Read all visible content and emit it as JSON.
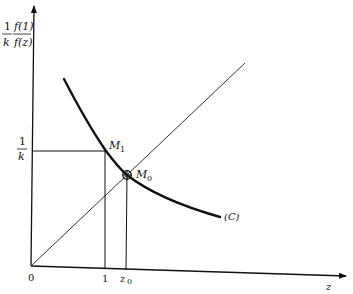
{
  "figure": {
    "y_axis_label": {
      "left_numerator": "1",
      "left_denominator": "k",
      "right_numerator": "f(1)",
      "right_denominator": "f(z)"
    },
    "x_axis_label": "z",
    "origin_label": "0",
    "x_ticks": [
      {
        "label": "1",
        "x": 105
      },
      {
        "label": "z",
        "sub": "0",
        "x": 126
      }
    ],
    "y_tick": {
      "numerator": "1",
      "denominator": "k",
      "y": 151
    },
    "points": {
      "M1": {
        "label": "M",
        "sub": "1",
        "x": 106,
        "y": 151
      },
      "M0": {
        "label": "M",
        "sub": "0",
        "x": 127,
        "y": 175
      }
    },
    "curve_label": "(C)",
    "colors": {
      "ink": "#111111",
      "background": "#ffffff"
    }
  }
}
